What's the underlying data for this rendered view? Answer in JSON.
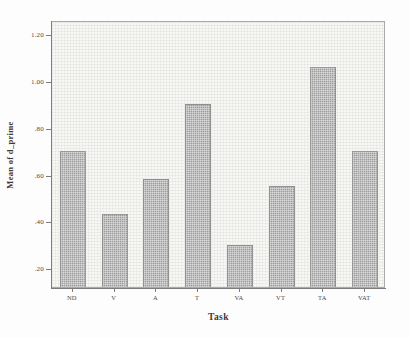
{
  "chart_data": {
    "type": "bar",
    "title": "",
    "xlabel": "Task",
    "ylabel": "Mean of d_prime",
    "categories": [
      "ND",
      "V",
      "A",
      "T",
      "VA",
      "VT",
      "TA",
      "VAT"
    ],
    "values": [
      0.7,
      0.43,
      0.58,
      0.9,
      0.3,
      0.55,
      1.06,
      0.7
    ],
    "ylim": [
      0.12,
      1.26
    ],
    "yticks": [
      0.2,
      0.4,
      0.6,
      0.8,
      1.0,
      1.2
    ],
    "ytick_labels": [
      ".20",
      ".40",
      ".60",
      ".80",
      "1.00",
      "1.20"
    ],
    "grid": false,
    "legend": null,
    "bar_color": "#9a9a9a",
    "plot_background": "#f7f7f4",
    "axis_color": "#7c7c7c"
  },
  "axes": {
    "y_title": "Mean of d_prime",
    "x_title": "Task"
  }
}
